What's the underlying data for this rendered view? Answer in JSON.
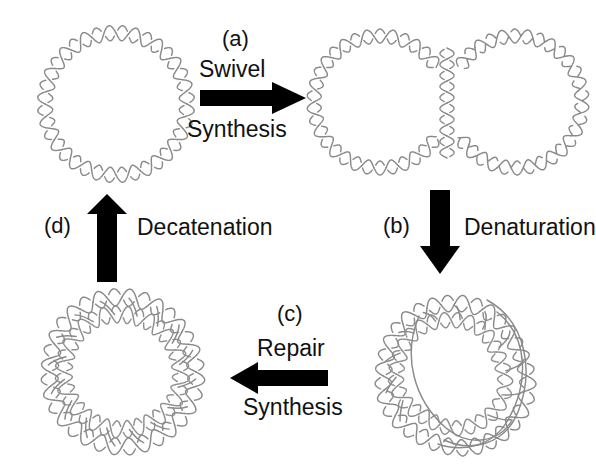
{
  "figure": {
    "background": "#ffffff",
    "dna_stroke": "#8a8a8a",
    "arrow_color": "#000000",
    "text_color": "#111111"
  },
  "steps": [
    {
      "id": "a",
      "panel_label": "(a)",
      "line1": "Swivel",
      "line2": "Synthesis",
      "arrow_icon": "arrow-right-icon",
      "direction": "right"
    },
    {
      "id": "b",
      "panel_label": "(b)",
      "line1": "Denaturation",
      "line2": "",
      "arrow_icon": "arrow-down-icon",
      "direction": "down"
    },
    {
      "id": "c",
      "panel_label": "(c)",
      "line1": "Repair",
      "line2": "Synthesis",
      "arrow_icon": "arrow-left-icon",
      "direction": "left"
    },
    {
      "id": "d",
      "panel_label": "(d)",
      "line1": "Decatenation",
      "line2": "",
      "arrow_icon": "arrow-up-icon",
      "direction": "up"
    }
  ],
  "structures": [
    {
      "id": "monomer-circle",
      "name": "circular-dna-duplex",
      "position": "top-left",
      "crossings": 18
    },
    {
      "id": "theta-twin-circles",
      "name": "replicated-twin-circles",
      "position": "top-right",
      "crossings": 18
    },
    {
      "id": "denatured-catenane",
      "name": "partially-denatured-catenane",
      "position": "bottom-right",
      "crossings": 16
    },
    {
      "id": "catenane",
      "name": "catenated-double-ring",
      "position": "bottom-left",
      "crossings": 16
    }
  ]
}
